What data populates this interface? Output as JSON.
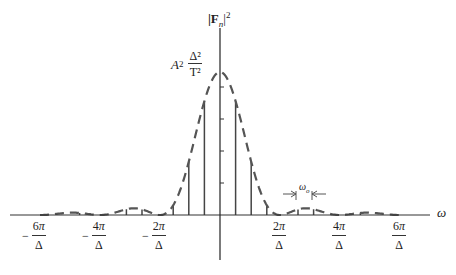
{
  "chart_data": {
    "type": "line",
    "title": "",
    "ylabel": "|F_n|^2",
    "xlabel": "ω",
    "peak_label": "A^2 Δ^2 / T^2",
    "spacing_label": "ω_o",
    "envelope": "sinc^2 (dashed)",
    "x_ticks": [
      "-6π/Δ",
      "-4π/Δ",
      "-2π/Δ",
      "2π/Δ",
      "4π/Δ",
      "6π/Δ"
    ],
    "stems_description": "discrete spectral lines spaced ω_o under sinc² envelope",
    "zeros_at": [
      "±2π/Δ",
      "±4π/Δ",
      "±6π/Δ"
    ]
  },
  "labels": {
    "yaxis": "|F",
    "yaxis_sub": "n",
    "yaxis_sup": "2",
    "xaxis": "ω",
    "peak_A": "A",
    "peak_A_sup": "2",
    "peak_num": "Δ²",
    "peak_den": "T²",
    "omega_o": "ω",
    "omega_o_sub": "o",
    "ticks": [
      {
        "sign": "−",
        "num": "6π",
        "den": "Δ"
      },
      {
        "sign": "−",
        "num": "4π",
        "den": "Δ"
      },
      {
        "sign": "−",
        "num": "2π",
        "den": "Δ"
      },
      {
        "sign": "",
        "num": "2π",
        "den": "Δ"
      },
      {
        "sign": "",
        "num": "4π",
        "den": "Δ"
      },
      {
        "sign": "",
        "num": "6π",
        "den": "Δ"
      }
    ]
  }
}
